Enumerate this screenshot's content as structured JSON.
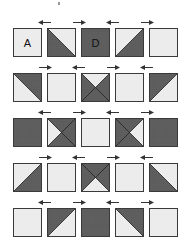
{
  "diagram": {
    "type": "quilt-block-layout",
    "colors": {
      "light": "#ececec",
      "dark": "#5a5a5a",
      "dark_print": "#7a7a7a",
      "border": "#3a3a3a",
      "arrow": "#333333"
    },
    "layout": {
      "columns_x": [
        13,
        47,
        81,
        115,
        149
      ],
      "rows_y": [
        28,
        73,
        118,
        163,
        208
      ],
      "block_size": 29,
      "arrow_y_offset": -8
    },
    "rows": [
      {
        "arrows": [
          "left",
          "right",
          "left",
          "right"
        ],
        "blocks": [
          {
            "kind": "plain",
            "fill": "light",
            "label": "A"
          },
          {
            "kind": "hst",
            "light": "top-right",
            "dark": "bottom-left",
            "label": ""
          },
          {
            "kind": "plain",
            "fill": "dark",
            "label": "D"
          },
          {
            "kind": "hst",
            "light": "top-left",
            "dark": "bottom-right",
            "label": ""
          },
          {
            "kind": "plain",
            "fill": "light",
            "label": ""
          }
        ]
      },
      {
        "arrows": [
          "right",
          "left",
          "right",
          "left"
        ],
        "blocks": [
          {
            "kind": "hst",
            "light": "bottom-left",
            "dark": "top-right",
            "label": ""
          },
          {
            "kind": "plain",
            "fill": "light",
            "label": ""
          },
          {
            "kind": "qst",
            "light": "top",
            "label": ""
          },
          {
            "kind": "plain",
            "fill": "light",
            "label": ""
          },
          {
            "kind": "hst",
            "light": "bottom-right",
            "dark": "top-left",
            "label": ""
          }
        ]
      },
      {
        "arrows": [
          "left",
          "right",
          "left",
          "right"
        ],
        "blocks": [
          {
            "kind": "plain",
            "fill": "dark",
            "label": ""
          },
          {
            "kind": "qst",
            "light": "left",
            "label": ""
          },
          {
            "kind": "plain",
            "fill": "light",
            "label": ""
          },
          {
            "kind": "qst",
            "light": "right",
            "label": ""
          },
          {
            "kind": "plain",
            "fill": "dark",
            "label": ""
          }
        ]
      },
      {
        "arrows": [
          "right",
          "left",
          "right",
          "left"
        ],
        "blocks": [
          {
            "kind": "hst",
            "light": "top-left",
            "dark": "bottom-right",
            "label": ""
          },
          {
            "kind": "plain",
            "fill": "light",
            "label": ""
          },
          {
            "kind": "qst",
            "light": "bottom",
            "label": ""
          },
          {
            "kind": "plain",
            "fill": "light",
            "label": ""
          },
          {
            "kind": "hst",
            "light": "top-right",
            "dark": "bottom-left",
            "label": ""
          }
        ]
      },
      {
        "arrows": [
          "left",
          "right",
          "left",
          "right"
        ],
        "blocks": [
          {
            "kind": "plain",
            "fill": "light",
            "label": ""
          },
          {
            "kind": "hst",
            "light": "bottom-right",
            "dark": "top-left",
            "label": ""
          },
          {
            "kind": "plain",
            "fill": "dark",
            "label": ""
          },
          {
            "kind": "hst",
            "light": "bottom-left",
            "dark": "top-right",
            "label": ""
          },
          {
            "kind": "plain",
            "fill": "light",
            "label": ""
          }
        ]
      }
    ]
  }
}
